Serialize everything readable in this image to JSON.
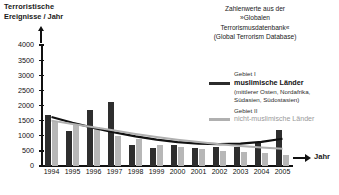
{
  "axis_titles": {
    "y_line1": "Terroristische",
    "y_line2": "Ereignisse / Jahr",
    "x": "Jahr",
    "y_arrow_icon": "arrow-up-icon",
    "x_arrow_icon": "arrow-right-icon"
  },
  "source_note": {
    "line1": "Zahlenwerte aus der",
    "line2": "»Globalen",
    "line3": "Terrorismusdatenbank«",
    "line4": "(Global Terrorism Database)"
  },
  "legend": {
    "series1": {
      "category": "Gebiet I",
      "name": "muslimische Länder",
      "detail_line1": "(mittlerer Osten, Nordafrika,",
      "detail_line2": "Südasien, Südostasien)",
      "color": "#2e2e2e"
    },
    "series2": {
      "category": "Gebiet II",
      "name": "nicht-muslimische Länder",
      "color": "#b0b0b0"
    }
  },
  "chart_data": {
    "type": "bar",
    "title": "Terroristische Ereignisse / Jahr",
    "xlabel": "Jahr",
    "ylabel": "Terroristische Ereignisse / Jahr",
    "categories": [
      "1994",
      "1995",
      "1996",
      "1997",
      "1998",
      "1999",
      "2000",
      "2001",
      "2002",
      "2003",
      "2004",
      "2005"
    ],
    "ylim": [
      0,
      4000
    ],
    "yticks": [
      0,
      500,
      1000,
      1500,
      2000,
      2500,
      3000,
      3500,
      4000
    ],
    "grid": false,
    "legend_position": "right",
    "series": [
      {
        "name": "muslimische Länder",
        "color": "#2e2e2e",
        "values": [
          1700,
          1150,
          1850,
          2100,
          700,
          600,
          680,
          600,
          630,
          620,
          780,
          1200
        ]
      },
      {
        "name": "nicht-muslimische Länder",
        "color": "#b7b7b7",
        "values": [
          1500,
          1400,
          1300,
          1000,
          900,
          700,
          620,
          560,
          500,
          470,
          420,
          380
        ]
      }
    ],
    "trend_lines": [
      {
        "name": "Trend muslimische Länder",
        "color": "#111111",
        "values": [
          1620,
          1430,
          1260,
          1110,
          980,
          870,
          790,
          740,
          720,
          740,
          800,
          900
        ]
      },
      {
        "name": "Trend nicht-muslimische Länder",
        "color": "#b0b0b0",
        "values": [
          1500,
          1390,
          1280,
          1170,
          1060,
          960,
          870,
          790,
          720,
          660,
          610,
          570
        ]
      }
    ]
  }
}
